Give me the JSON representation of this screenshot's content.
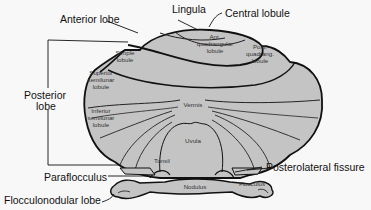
{
  "diagram": {
    "colors": {
      "tissue_fill": "#c4c4c4",
      "outline": "#111111",
      "background": "#f8f8f8",
      "label_text": "#111111"
    },
    "external_labels": {
      "lingula": "Lingula",
      "central_lobule": "Central lobule",
      "anterior_lobe": "Anterior lobe",
      "posterior_lobe_line1": "Posterior",
      "posterior_lobe_line2": "lobe",
      "paraflocculus": "Paraflocculus",
      "posterolateral_fissure": "Posterolateral fissure",
      "flocculonodular_lobe": "Flocculonodular lobe"
    },
    "internal_labels": {
      "simple_lobule": [
        "Simple",
        "lobule"
      ],
      "ant_quadrangular_lobule": [
        "Ant.",
        "quadrangular",
        "lobule"
      ],
      "post_quadrangular_lobule": [
        "Post.",
        "quadrang.",
        "lobule"
      ],
      "superior_semilunar_lobule": [
        "Superior",
        "semilunar",
        "lobule"
      ],
      "inferior_semilunar_lobule": [
        "Inferior",
        "semilunar",
        "lobule"
      ],
      "vermis": "Vermis",
      "uvula": "Uvula",
      "tonsil": "Tonsil",
      "nodulus": "Nodulus",
      "flocculus": "Flocculus"
    }
  }
}
